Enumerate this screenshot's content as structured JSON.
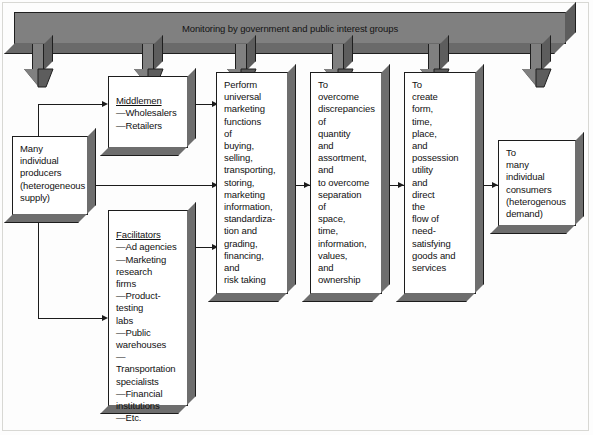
{
  "diagram": {
    "band": {
      "label": "Monitoring by government and public interest groups",
      "color": "#808080"
    },
    "arrow_count": 6,
    "boxes": {
      "producers": {
        "text": "Many\nindividual\nproducers\n(heterogeneous\nsupply)"
      },
      "middlemen": {
        "header": "Middlemen",
        "bullets": "—Wholesalers\n—Retailers"
      },
      "facilitators": {
        "header": "Facilitators",
        "bullets": "—Ad agencies\n—Marketing\n    research\n    firms\n—Product-\n    testing\n    labs\n—Public\n    warehouses\n—Transportation\n    specialists\n—Financial\n    institutions\n—Etc."
      },
      "functions": {
        "text": "Perform\nuniversal\nmarketing\nfunctions\nof\nbuying,\nselling,\ntransporting,\nstoring,\nmarketing\ninformation,\nstandardiza-\ntion and\ngrading,\nfinancing,\nand\nrisk taking"
      },
      "discrepancies": {
        "text": "To\novercome\ndiscrepancies\nof\nquantity\nand\nassortment,\nand\nto overcome\nseparation\nof\nspace,\ntime,\ninformation,\nvalues,\nand\nownership"
      },
      "utility": {
        "text": "To\ncreate\nform,\ntime,\nplace,\nand\npossession\nutility\nand\ndirect\nthe\nflow of\nneed-\nsatisfying\ngoods and\nservices"
      },
      "consumers": {
        "text": "To\nmany\nindividual\nconsumers\n(heterogenous\ndemand)"
      }
    },
    "colors": {
      "band_face": "#808080",
      "box_shadow": "#6e6e6e",
      "line": "#1c1c1c",
      "background": "#fdfdfd"
    }
  }
}
